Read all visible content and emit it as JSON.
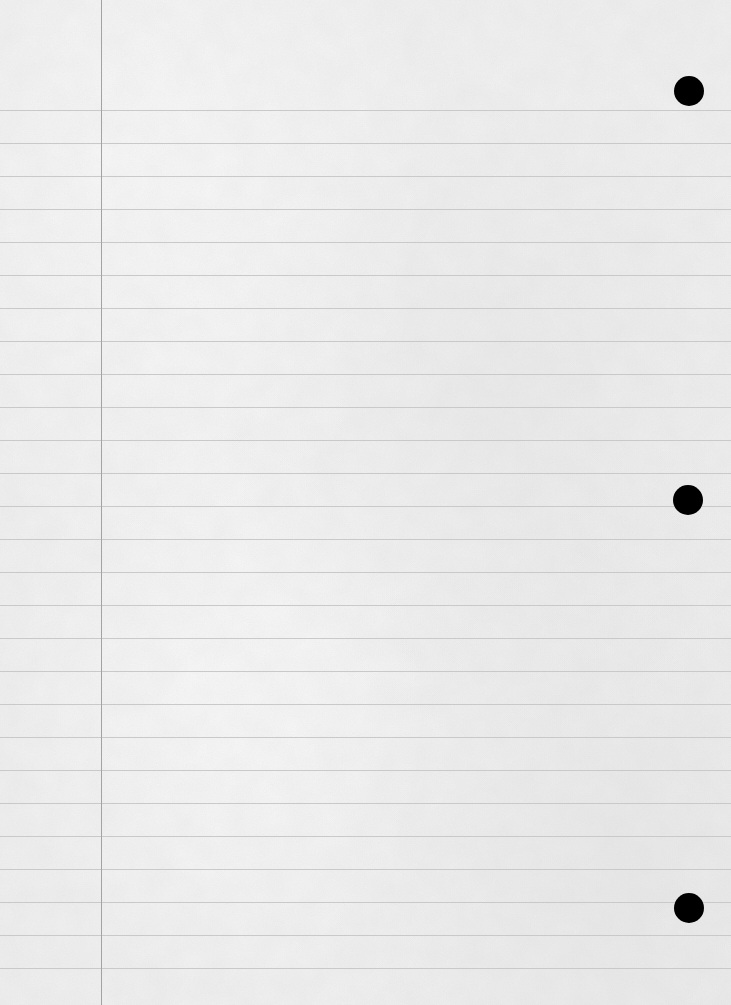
{
  "page": {
    "type": "lined-notebook-paper",
    "width": 731,
    "height": 1005,
    "colors": {
      "paper": "#f3f3f3",
      "rule": "#c9c9c9",
      "margin": "#a3a3a3",
      "hole": "#000000"
    },
    "rules": {
      "first_y": 110,
      "spacing": 33,
      "count": 27
    },
    "margin_line": {
      "x": 101
    },
    "holes": [
      {
        "cx": 689,
        "cy": 91,
        "r": 15
      },
      {
        "cx": 688,
        "cy": 500,
        "r": 15
      },
      {
        "cx": 689,
        "cy": 908,
        "r": 15
      }
    ]
  }
}
